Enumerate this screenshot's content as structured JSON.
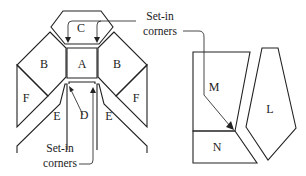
{
  "diagram": {
    "left_figure": {
      "pieces": {
        "A": "A",
        "B_left": "B",
        "B_right": "B",
        "C": "C",
        "D": "D",
        "E_left": "E",
        "E_right": "E",
        "F_left": "F",
        "F_right": "F"
      },
      "callout_top": {
        "line1": "Set-in",
        "line2": "corners"
      },
      "callout_bottom": {
        "line1": "Set-in",
        "line2": "corners"
      }
    },
    "right_figure": {
      "pieces": {
        "M": "M",
        "N": "N",
        "L": "L"
      }
    },
    "colors": {
      "stroke": "#222222",
      "background": "#ffffff"
    }
  }
}
